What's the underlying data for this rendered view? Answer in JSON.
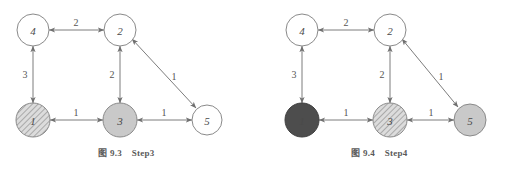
{
  "page": {
    "background": "#ffffff",
    "stroke_color": "#7a7a7a",
    "text_color": "#4a4a4a"
  },
  "palette": {
    "white": "#ffffff",
    "light_gray": "#c9c9c9",
    "dark_gray": "#4d4d4d",
    "hatch_base": "#d8d8d8",
    "hatch_line": "#8d8d8d",
    "outline": "#8a8a8a"
  },
  "figures": [
    {
      "id": "fig-9-3",
      "caption_number": "图 9.3",
      "caption_step": "Step3",
      "nodes": [
        {
          "id": "4",
          "label": "4",
          "cx": 33,
          "cy": 30,
          "r": 16,
          "fill": "white",
          "style": "plain"
        },
        {
          "id": "2",
          "label": "2",
          "cx": 120,
          "cy": 30,
          "r": 16,
          "fill": "white",
          "style": "plain"
        },
        {
          "id": "1",
          "label": "1",
          "cx": 33,
          "cy": 120,
          "r": 17,
          "fill": "hatch_base",
          "style": "hatched"
        },
        {
          "id": "3",
          "label": "3",
          "cx": 120,
          "cy": 120,
          "r": 17,
          "fill": "light_gray",
          "style": "filled"
        },
        {
          "id": "5",
          "label": "5",
          "cx": 207,
          "cy": 120,
          "r": 15,
          "fill": "white",
          "style": "plain"
        }
      ],
      "edges": [
        {
          "from": "4",
          "to": "2",
          "weight": "2",
          "lx": 76,
          "ly": 22,
          "direction": "both"
        },
        {
          "from": "4",
          "to": "1",
          "weight": "3",
          "lx": 25,
          "ly": 74,
          "direction": "both"
        },
        {
          "from": "2",
          "to": "3",
          "weight": "2",
          "lx": 112,
          "ly": 74,
          "direction": "both"
        },
        {
          "from": "2",
          "to": "5",
          "weight": "1",
          "lx": 174,
          "ly": 76,
          "direction": "both"
        },
        {
          "from": "1",
          "to": "3",
          "weight": "1",
          "lx": 76,
          "ly": 112,
          "direction": "both"
        },
        {
          "from": "3",
          "to": "5",
          "weight": "1",
          "lx": 164,
          "ly": 112,
          "direction": "both"
        }
      ]
    },
    {
      "id": "fig-9-4",
      "caption_number": "图 9.4",
      "caption_step": "Step4",
      "nodes": [
        {
          "id": "4",
          "label": "4",
          "cx": 49,
          "cy": 30,
          "r": 16,
          "fill": "white",
          "style": "plain"
        },
        {
          "id": "2",
          "label": "2",
          "cx": 137,
          "cy": 30,
          "r": 16,
          "fill": "white",
          "style": "plain"
        },
        {
          "id": "1",
          "label": "1",
          "cx": 49,
          "cy": 120,
          "r": 17,
          "fill": "dark_gray",
          "style": "filled"
        },
        {
          "id": "3",
          "label": "3",
          "cx": 137,
          "cy": 120,
          "r": 17,
          "fill": "hatch_base",
          "style": "hatched"
        },
        {
          "id": "5",
          "label": "5",
          "cx": 217,
          "cy": 120,
          "r": 16,
          "fill": "light_gray",
          "style": "filled"
        }
      ],
      "edges": [
        {
          "from": "4",
          "to": "2",
          "weight": "2",
          "lx": 93,
          "ly": 22,
          "direction": "both"
        },
        {
          "from": "4",
          "to": "1",
          "weight": "3",
          "lx": 41,
          "ly": 74,
          "direction": "both"
        },
        {
          "from": "2",
          "to": "3",
          "weight": "2",
          "lx": 129,
          "ly": 74,
          "direction": "both"
        },
        {
          "from": "2",
          "to": "5",
          "weight": "1",
          "lx": 188,
          "ly": 76,
          "direction": "both"
        },
        {
          "from": "1",
          "to": "3",
          "weight": "1",
          "lx": 93,
          "ly": 112,
          "direction": "both"
        },
        {
          "from": "3",
          "to": "5",
          "weight": "1",
          "lx": 178,
          "ly": 112,
          "direction": "both"
        }
      ]
    }
  ]
}
